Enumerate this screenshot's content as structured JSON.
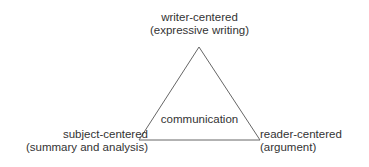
{
  "diagram": {
    "top_vertex": {
      "line1": "writer-centered",
      "line2": "(expressive writing)"
    },
    "left_vertex": {
      "line1": "subject-centered",
      "line2": "(summary and analysis)"
    },
    "right_vertex": {
      "line1": "reader-centered",
      "line2": "(argument)"
    },
    "center_label": "communication",
    "line_color": "#555555",
    "text_color": "#333333"
  }
}
